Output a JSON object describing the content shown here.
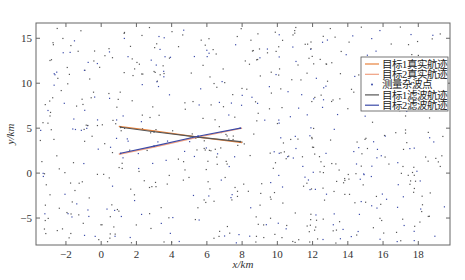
{
  "chart_data": {
    "type": "scatter",
    "title": "",
    "xlabel": "x/km",
    "ylabel": "y/km",
    "xlim": [
      -3.7,
      19.8
    ],
    "ylim": [
      -8,
      16.7
    ],
    "xticks": [
      -2,
      0,
      2,
      4,
      6,
      8,
      10,
      12,
      14,
      16,
      18
    ],
    "yticks": [
      -5,
      0,
      5,
      10,
      15
    ],
    "grid": false,
    "legend_position": "upper right",
    "legend": [
      {
        "label": "目标1真实航迹",
        "color": "#e8823c",
        "style": "line"
      },
      {
        "label": "目标2真实航迹",
        "color": "#f0a080",
        "style": "line"
      },
      {
        "label": "测量杂波点",
        "color": "#3a4aa8",
        "style": "dot"
      },
      {
        "label": "目标1滤波航迹",
        "color": "#555555",
        "style": "line"
      },
      {
        "label": "目标2滤波航迹",
        "color": "#3a4aa8",
        "style": "line"
      }
    ],
    "series": [
      {
        "name": "目标1真实航迹",
        "x": [
          1.0,
          3.0,
          5.5,
          8.0
        ],
        "y": [
          5.2,
          4.7,
          4.0,
          3.4
        ]
      },
      {
        "name": "目标2真实航迹",
        "x": [
          1.0,
          3.0,
          5.5,
          8.0
        ],
        "y": [
          2.1,
          2.9,
          4.0,
          5.0
        ]
      },
      {
        "name": "目标1滤波航迹",
        "x": [
          1.1,
          3.0,
          5.5,
          7.9
        ],
        "y": [
          5.1,
          4.6,
          4.0,
          3.5
        ]
      },
      {
        "name": "目标2滤波航迹",
        "x": [
          1.1,
          3.0,
          5.5,
          7.9
        ],
        "y": [
          2.2,
          3.0,
          4.1,
          5.0
        ]
      }
    ],
    "clutter": {
      "count": 700,
      "x_range": [
        -3.5,
        19.5
      ],
      "y_range": [
        -7.8,
        16.3
      ],
      "distribution": "uniform"
    }
  }
}
